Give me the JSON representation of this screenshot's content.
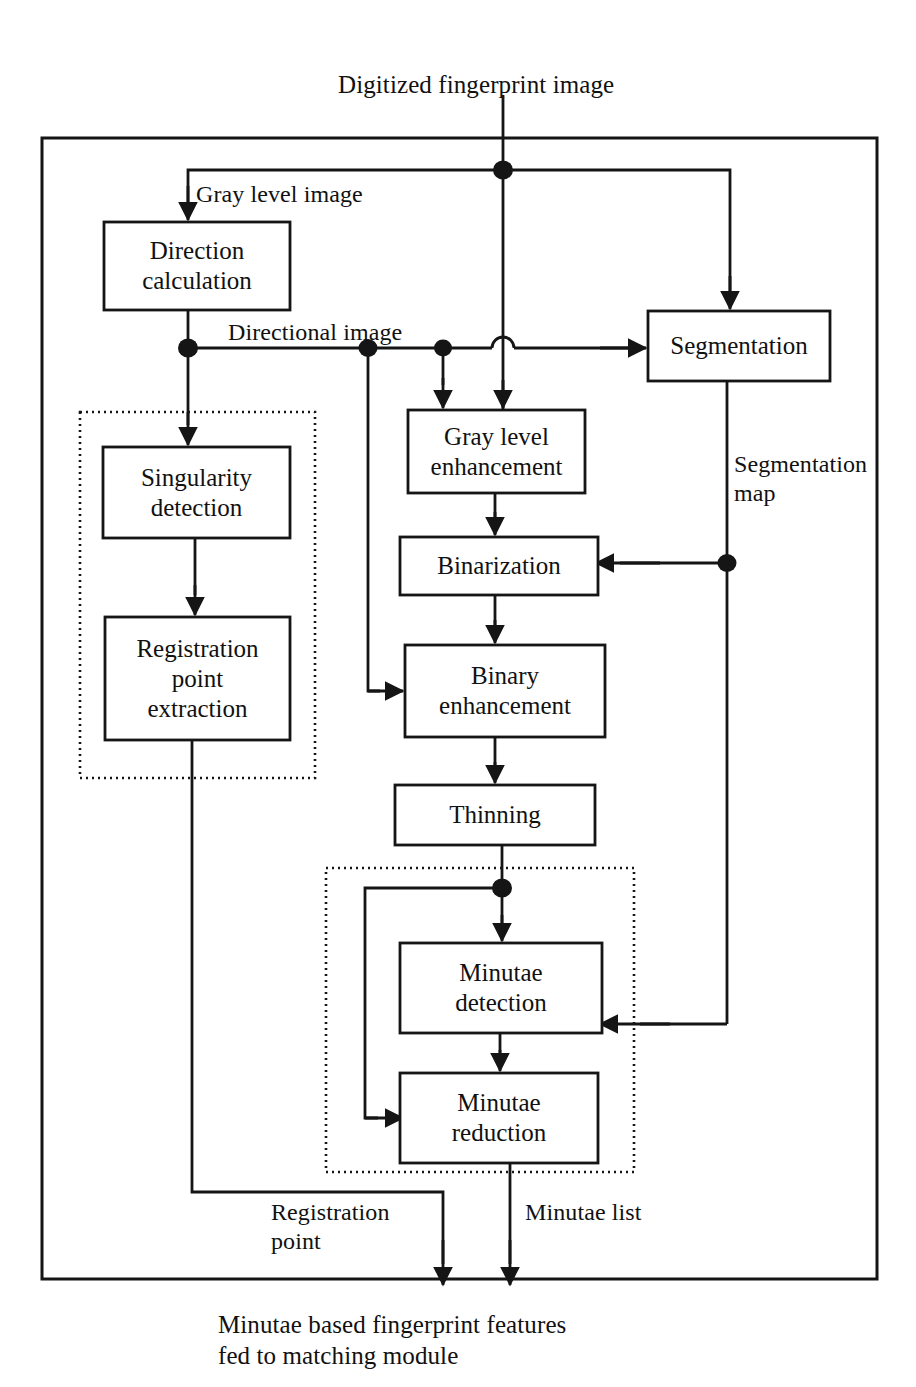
{
  "diagram": {
    "stroke_color": "#151515",
    "background": "#ffffff",
    "inputs": [
      {
        "id": "input-top",
        "text": "Digitized fingerprint image"
      }
    ],
    "outputs": [
      {
        "id": "output-bottom",
        "text": "Minutae based fingerprint features\nfed to matching module"
      }
    ],
    "nodes": [
      {
        "id": "direction-calculation",
        "label": "Direction\ncalculation",
        "x": 104,
        "y": 222,
        "w": 186,
        "h": 88,
        "lines": 2
      },
      {
        "id": "segmentation",
        "label": "Segmentation",
        "x": 648,
        "y": 311,
        "w": 182,
        "h": 70,
        "lines": 1
      },
      {
        "id": "singularity-detection",
        "label": "Singularity\ndetection",
        "x": 103,
        "y": 447,
        "w": 187,
        "h": 91,
        "lines": 2
      },
      {
        "id": "registration-point-extraction",
        "label": "Registration\npoint\nextraction",
        "x": 105,
        "y": 617,
        "w": 185,
        "h": 123,
        "lines": 3
      },
      {
        "id": "gray-level-enhancement",
        "label": "Gray level\nenhancement",
        "x": 408,
        "y": 410,
        "w": 177,
        "h": 83,
        "lines": 2
      },
      {
        "id": "binarization",
        "label": "Binarization",
        "x": 400,
        "y": 537,
        "w": 198,
        "h": 58,
        "lines": 1
      },
      {
        "id": "binary-enhancement",
        "label": "Binary\nenhancement",
        "x": 405,
        "y": 645,
        "w": 200,
        "h": 92,
        "lines": 2
      },
      {
        "id": "thinning",
        "label": "Thinning",
        "x": 395,
        "y": 785,
        "w": 200,
        "h": 60,
        "lines": 1
      },
      {
        "id": "minutae-detection",
        "label": "Minutae\ndetection",
        "x": 400,
        "y": 943,
        "w": 202,
        "h": 90,
        "lines": 2
      },
      {
        "id": "minutae-reduction",
        "label": "Minutae\nreduction",
        "x": 400,
        "y": 1073,
        "w": 198,
        "h": 90,
        "lines": 2
      }
    ],
    "groups": [
      {
        "id": "registration-group",
        "x": 80,
        "y": 412,
        "w": 235,
        "h": 366
      },
      {
        "id": "minutae-group",
        "x": 326,
        "y": 868,
        "w": 308,
        "h": 304
      }
    ],
    "frame": {
      "id": "outer-frame",
      "x": 42,
      "y": 138,
      "w": 835,
      "h": 1141
    },
    "edge_labels": [
      {
        "id": "gray-level-image",
        "text": "Gray level image",
        "x": 196,
        "y": 180
      },
      {
        "id": "directional-image",
        "text": "Directional image",
        "x": 228,
        "y": 318
      },
      {
        "id": "segmentation-map",
        "text": "Segmentation\nmap",
        "x": 734,
        "y": 450
      },
      {
        "id": "registration-point",
        "text": "Registration\npoint",
        "x": 271,
        "y": 1198
      },
      {
        "id": "minutae-list",
        "text": "Minutae list",
        "x": 525,
        "y": 1198
      }
    ],
    "input_label_pos": {
      "x": 338,
      "y": 70
    },
    "output_label_pos": {
      "x": 218,
      "y": 1310
    }
  }
}
